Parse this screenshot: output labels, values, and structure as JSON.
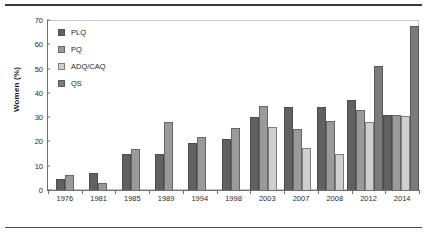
{
  "chart_data": {
    "type": "bar",
    "title": "",
    "subtitle": "",
    "xlabel": "",
    "ylabel": "Women (%)",
    "ylim": [
      0,
      70
    ],
    "ytick_step": 10,
    "yticks": [
      0,
      10,
      20,
      30,
      40,
      50,
      60,
      70
    ],
    "grid": false,
    "legend_position": "top-left",
    "categories": [
      "1976",
      "1981",
      "1985",
      "1989",
      "1994",
      "1998",
      "2003",
      "2007",
      "2008",
      "2012",
      "2014"
    ],
    "series": [
      {
        "name": "PLQ",
        "color": "#616161",
        "values": [
          4.5,
          7,
          15,
          15,
          19.5,
          21,
          30,
          34,
          34,
          37,
          31
        ]
      },
      {
        "name": "PQ",
        "color": "#9a9a9a",
        "values": [
          6,
          3,
          17,
          28,
          22,
          25.5,
          34.5,
          25,
          28.5,
          33,
          31
        ]
      },
      {
        "name": "ADQ/CAQ",
        "color": "#cfcfcf",
        "values": [
          null,
          null,
          null,
          null,
          null,
          null,
          26,
          17.5,
          15,
          28,
          30.5
        ]
      },
      {
        "name": "QS",
        "color": "#7b7b7b",
        "values": [
          null,
          null,
          null,
          null,
          null,
          null,
          null,
          null,
          null,
          51,
          67.5
        ]
      }
    ]
  },
  "figure": {
    "top_rule": true,
    "bottom_rule": true,
    "frame_color": "#c8c8c8",
    "axis_color": "#6f6f6f",
    "background": "#ffffff"
  }
}
